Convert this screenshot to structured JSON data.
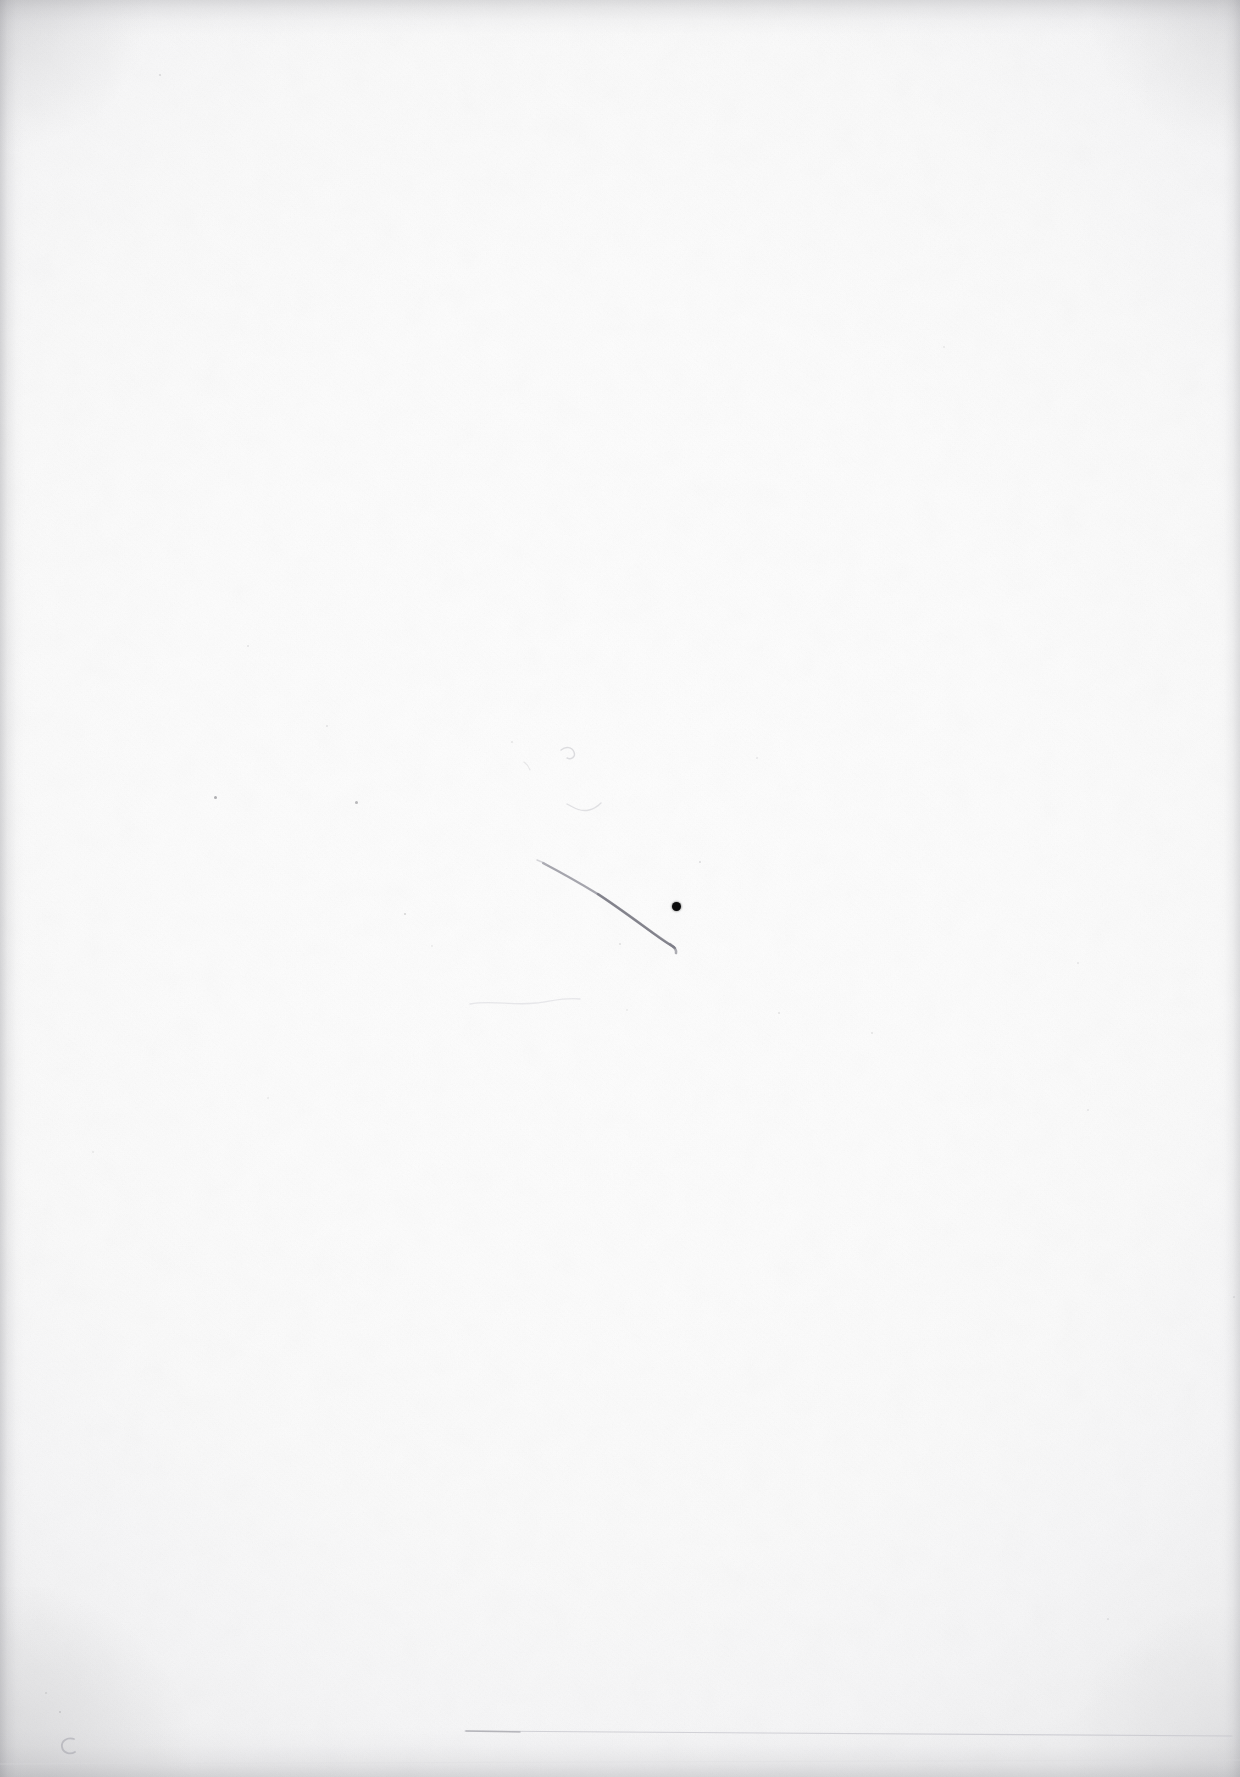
{
  "document": {
    "kind": "scanned-blank-page",
    "description": "Blank scanned paper page (verso) with faint handwriting stroke, ink dot and edge shadows",
    "page_width": 1240,
    "page_height": 1777,
    "visible_text": "",
    "paper_color": "#fefefe",
    "ink_color": "#0b0b0c",
    "pencil_color": "#9a9aa0",
    "edge_shadow_color": "#8c8c92"
  },
  "marks": {
    "ink_dot": {
      "name": "ink-dot",
      "x": 676,
      "y": 906,
      "diameter": 9,
      "color": "#0b0b0c"
    },
    "pen_stroke": {
      "name": "curved-pen-stroke",
      "color": "#8e8e95",
      "start_x": 543,
      "start_y": 863,
      "end_x": 674,
      "end_y": 947
    },
    "pencil_squiggle": {
      "name": "pencil-squiggle",
      "color": "#b9b9bf",
      "x": 566,
      "y": 752
    },
    "baseline_rule": {
      "name": "faint-horizontal-rule",
      "color": "#c9c9cf",
      "start_x": 465,
      "end_x": 1232,
      "y": 1732
    },
    "corner_glyph": {
      "name": "pencil-c-mark",
      "label": "C",
      "x": 68,
      "y": 1745,
      "color": "#b0b0b6"
    },
    "specks": [
      {
        "x": 248,
        "y": 646,
        "d": 2.0,
        "o": 0.12
      },
      {
        "x": 215,
        "y": 797,
        "d": 3.0,
        "o": 0.34
      },
      {
        "x": 356,
        "y": 802,
        "d": 3.4,
        "o": 0.3
      },
      {
        "x": 405,
        "y": 914,
        "d": 2.2,
        "o": 0.18
      },
      {
        "x": 327,
        "y": 726,
        "d": 1.8,
        "o": 0.12
      },
      {
        "x": 512,
        "y": 742,
        "d": 1.8,
        "o": 0.11
      },
      {
        "x": 620,
        "y": 944,
        "d": 1.6,
        "o": 0.13
      },
      {
        "x": 700,
        "y": 862,
        "d": 1.8,
        "o": 0.14
      },
      {
        "x": 757,
        "y": 758,
        "d": 1.6,
        "o": 0.1
      },
      {
        "x": 779,
        "y": 1013,
        "d": 2.0,
        "o": 0.13
      },
      {
        "x": 872,
        "y": 1033,
        "d": 2.0,
        "o": 0.13
      },
      {
        "x": 1078,
        "y": 963,
        "d": 1.8,
        "o": 0.11
      },
      {
        "x": 1088,
        "y": 1110,
        "d": 1.8,
        "o": 0.11
      },
      {
        "x": 944,
        "y": 347,
        "d": 1.6,
        "o": 0.1
      },
      {
        "x": 160,
        "y": 75,
        "d": 1.8,
        "o": 0.15
      },
      {
        "x": 93,
        "y": 1152,
        "d": 1.6,
        "o": 0.1
      },
      {
        "x": 268,
        "y": 1098,
        "d": 1.6,
        "o": 0.09
      },
      {
        "x": 1108,
        "y": 1619,
        "d": 1.8,
        "o": 0.12
      },
      {
        "x": 60,
        "y": 1712,
        "d": 2.2,
        "o": 0.16
      },
      {
        "x": 46,
        "y": 1693,
        "d": 1.8,
        "o": 0.13
      },
      {
        "x": 627,
        "y": 1010,
        "d": 1.6,
        "o": 0.09
      },
      {
        "x": 432,
        "y": 946,
        "d": 1.6,
        "o": 0.09
      },
      {
        "x": 1234,
        "y": 1297,
        "d": 1.8,
        "o": 0.12
      }
    ]
  }
}
